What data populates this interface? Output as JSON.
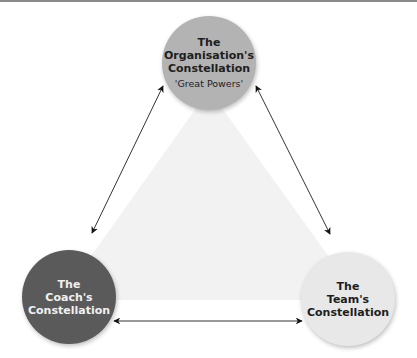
{
  "diagram": {
    "nodes": [
      {
        "id": "organisation",
        "title_lines": [
          "The",
          "Organisation's",
          "Constellation"
        ],
        "subtitle": "'Great Powers'",
        "color": "#b3b3b3",
        "text_color": "#1e1e1e"
      },
      {
        "id": "coach",
        "title_lines": [
          "The",
          "Coach's",
          "Constellation"
        ],
        "color": "#5a5a5a",
        "text_color": "#f0f0f0"
      },
      {
        "id": "team",
        "title_lines": [
          "The",
          "Team's",
          "Constellation"
        ],
        "color": "#e8e8e8",
        "text_color": "#1e1e1e"
      }
    ],
    "edges": [
      {
        "from": "organisation",
        "to": "coach",
        "type": "bidirectional-arrow"
      },
      {
        "from": "organisation",
        "to": "team",
        "type": "bidirectional-arrow"
      },
      {
        "from": "coach",
        "to": "team",
        "type": "bidirectional-arrow"
      }
    ],
    "background_triangle_color": "#f2f2f2"
  }
}
